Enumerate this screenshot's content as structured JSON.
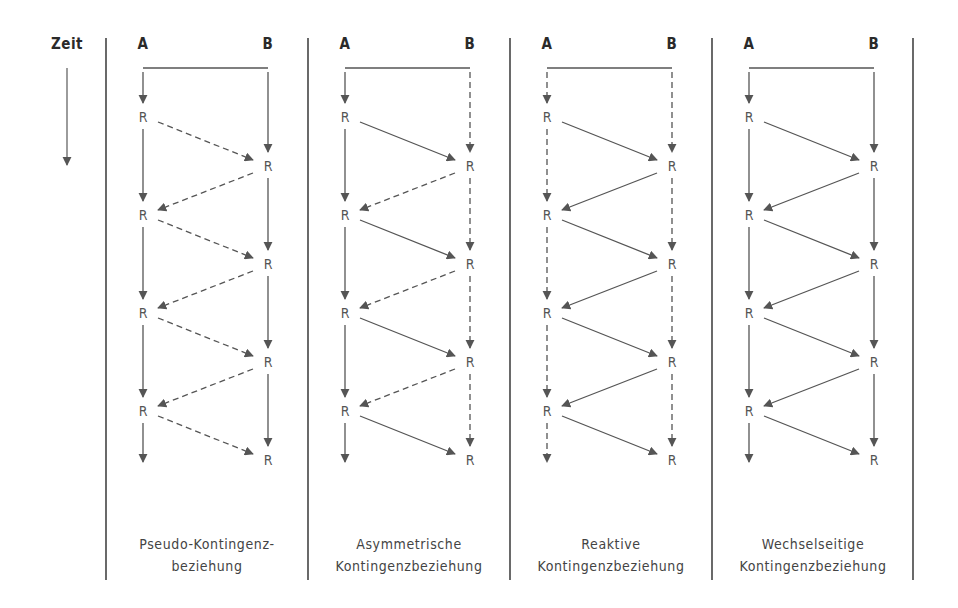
{
  "time_axis": {
    "label": "Zeit"
  },
  "actor_a": "A",
  "actor_b": "B",
  "response_label": "R",
  "dividers_x": [
    106,
    308,
    510,
    712,
    913
  ],
  "panels": [
    {
      "id": "pseudo",
      "caption_line1": "Pseudo-Kontingenz-",
      "caption_line2": "beziehung",
      "a_vertical_style": "solid",
      "b_vertical_style": "solid",
      "a_to_b_style": "dashed",
      "b_to_a_style": "dashed"
    },
    {
      "id": "asymmetric",
      "caption_line1": "Asymmetrische",
      "caption_line2": "Kontingenzbeziehung",
      "a_vertical_style": "solid",
      "b_vertical_style": "dashed",
      "a_to_b_style": "solid",
      "b_to_a_style": "dashed"
    },
    {
      "id": "reactive",
      "caption_line1": "Reaktive",
      "caption_line2": "Kontingenzbeziehung",
      "a_vertical_style": "dashed",
      "b_vertical_style": "dashed",
      "a_to_b_style": "solid",
      "b_to_a_style": "solid"
    },
    {
      "id": "mutual",
      "caption_line1": "Wechselseitige",
      "caption_line2": "Kontingenzbeziehung",
      "a_vertical_style": "solid",
      "b_vertical_style": "solid",
      "a_to_b_style": "solid",
      "b_to_a_style": "solid"
    }
  ],
  "layout": {
    "a_offset": 37,
    "b_offset": 162,
    "header_y": 45,
    "bar_y": 68,
    "a_r_y": [
      117,
      215,
      313,
      411
    ],
    "b_r_y": [
      166,
      264,
      362,
      460
    ],
    "end_arrow_y": 462
  }
}
